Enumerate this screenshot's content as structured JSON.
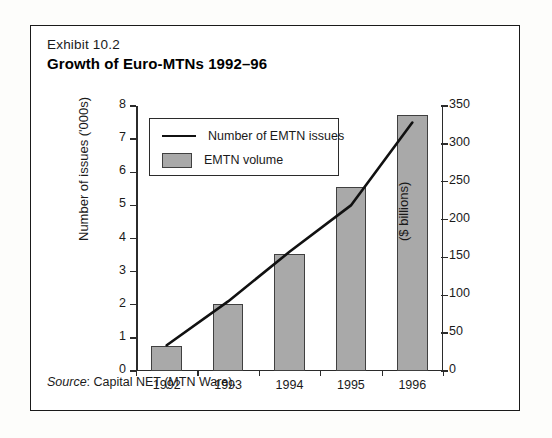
{
  "exhibit": {
    "label": "Exhibit 10.2",
    "title": "Growth of Euro-MTNs 1992–96",
    "source_keyword": "Source",
    "source_text": ": Capital NET (MTN Ware)."
  },
  "legend": {
    "line_label": "Number of EMTN issues",
    "bar_label": "EMTN volume"
  },
  "colors": {
    "bar_fill": "#a9a9a9",
    "bar_stroke": "#404040",
    "line": "#111111",
    "frame": "#1a1a1a",
    "background": "#ffffff"
  },
  "chart_data": {
    "type": "bar",
    "title": "Growth of Euro-MTNs 1992–96",
    "subtitle": "Exhibit 10.2",
    "categories": [
      "1992",
      "1993",
      "1994",
      "1995",
      "1996"
    ],
    "xlabel": "",
    "ylabel": "Number of issues ('000s)",
    "y2label": "($ billions)",
    "ylim": [
      0,
      8
    ],
    "y2lim": [
      0,
      350
    ],
    "yticks": [
      0,
      1,
      2,
      3,
      4,
      5,
      6,
      7,
      8
    ],
    "ytick_labels": [
      "0",
      "1",
      "2",
      "3",
      "4",
      "5",
      "6",
      "7",
      "8"
    ],
    "y2ticks": [
      0,
      50,
      100,
      150,
      200,
      250,
      300,
      350
    ],
    "y2tick_labels": [
      "0",
      "50",
      "100",
      "150",
      "200",
      "250",
      "300",
      "350"
    ],
    "grid": false,
    "legend_position": "upper left",
    "series": [
      {
        "name": "EMTN volume",
        "type": "bar",
        "axis": "right",
        "unit": "$ billions",
        "values": [
          33,
          88,
          155,
          243,
          338
        ]
      },
      {
        "name": "Number of EMTN issues",
        "type": "line",
        "axis": "left",
        "unit": "thousands of issues",
        "values": [
          0.78,
          2.1,
          3.6,
          5.0,
          7.5
        ]
      }
    ]
  }
}
